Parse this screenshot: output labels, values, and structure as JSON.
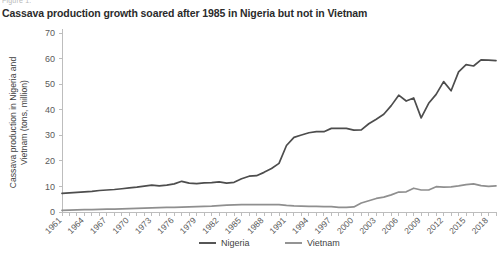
{
  "figure": {
    "kicker": "Figure 1.",
    "title": "Cassava production growth soared after 1985 in Nigeria but not in Vietnam"
  },
  "colors": {
    "nigeria": "#4d4d4d",
    "vietnam": "#8f8f8f",
    "axis": "#bdbdbd",
    "text": "#3f3f3f",
    "background": "#ffffff"
  },
  "legend": {
    "position": "bottom-center",
    "items": [
      {
        "label": "Nigeria",
        "color": "#4d4d4d"
      },
      {
        "label": "Vietnam",
        "color": "#8f8f8f"
      }
    ]
  },
  "chart_data": {
    "type": "line",
    "title": "Cassava production growth soared after 1985 in Nigeria but not in Vietnam",
    "xlabel": "",
    "ylabel": "Cassava production in Nigeria and Vietnam (tons, million)",
    "xlim": [
      1961,
      2019
    ],
    "ylim": [
      0,
      70
    ],
    "ytick_step": 10,
    "yticks": [
      0,
      10,
      20,
      30,
      40,
      50,
      60,
      70
    ],
    "xtick_step": 3,
    "xticks": [
      1961,
      1964,
      1967,
      1970,
      1973,
      1976,
      1979,
      1982,
      1985,
      1988,
      1991,
      1994,
      1997,
      2000,
      2003,
      2006,
      2009,
      2012,
      2015,
      2018
    ],
    "xtick_rotation": -45,
    "grid": false,
    "x": [
      1961,
      1962,
      1963,
      1964,
      1965,
      1966,
      1967,
      1968,
      1969,
      1970,
      1971,
      1972,
      1973,
      1974,
      1975,
      1976,
      1977,
      1978,
      1979,
      1980,
      1981,
      1982,
      1983,
      1984,
      1985,
      1986,
      1987,
      1988,
      1989,
      1990,
      1991,
      1992,
      1993,
      1994,
      1995,
      1996,
      1997,
      1998,
      1999,
      2000,
      2001,
      2002,
      2003,
      2004,
      2005,
      2006,
      2007,
      2008,
      2009,
      2010,
      2011,
      2012,
      2013,
      2014,
      2015,
      2016,
      2017,
      2018,
      2019
    ],
    "series": [
      {
        "name": "Nigeria",
        "color": "#4d4d4d",
        "values": [
          7.3,
          7.5,
          7.7,
          7.9,
          8.1,
          8.4,
          8.6,
          8.8,
          9.1,
          9.4,
          9.7,
          10.1,
          10.5,
          10.2,
          10.5,
          11.0,
          12.0,
          11.3,
          11.1,
          11.4,
          11.5,
          11.8,
          11.3,
          11.6,
          13.0,
          14.0,
          14.2,
          15.5,
          17.0,
          19.0,
          26.0,
          29.2,
          30.1,
          31.0,
          31.4,
          31.4,
          32.7,
          32.7,
          32.7,
          32.0,
          32.1,
          34.5,
          36.3,
          38.2,
          41.6,
          45.7,
          43.4,
          44.6,
          36.8,
          42.5,
          46.0,
          51.0,
          47.4,
          54.8,
          57.6,
          57.1,
          59.5,
          59.4,
          59.2
        ]
      },
      {
        "name": "Vietnam",
        "color": "#8f8f8f",
        "values": [
          0.6,
          0.7,
          0.8,
          0.9,
          0.9,
          1.0,
          1.1,
          1.1,
          1.2,
          1.3,
          1.4,
          1.5,
          1.6,
          1.7,
          1.8,
          1.8,
          1.9,
          2.0,
          2.1,
          2.2,
          2.3,
          2.5,
          2.7,
          2.8,
          2.9,
          2.9,
          2.9,
          2.9,
          2.9,
          2.9,
          2.6,
          2.4,
          2.3,
          2.2,
          2.2,
          2.1,
          2.1,
          1.8,
          1.8,
          2.0,
          3.5,
          4.4,
          5.3,
          5.8,
          6.7,
          7.8,
          7.9,
          9.3,
          8.6,
          8.6,
          9.9,
          9.7,
          9.8,
          10.2,
          10.7,
          11.0,
          10.3,
          10.0,
          10.2
        ]
      }
    ]
  }
}
